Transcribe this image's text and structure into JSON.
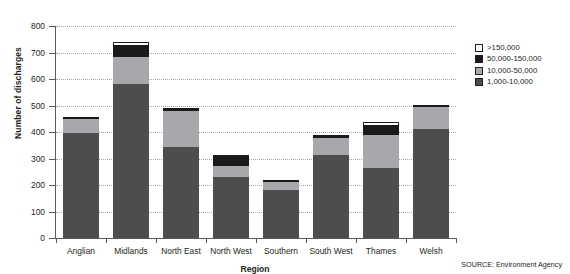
{
  "chart_data": {
    "type": "bar",
    "stacked": true,
    "title": "",
    "xlabel": "Region",
    "ylabel": "Number of discharges",
    "ylim": [
      0,
      800
    ],
    "ytick_step": 100,
    "yticks": [
      0,
      100,
      200,
      300,
      400,
      500,
      600,
      700,
      800
    ],
    "grid": true,
    "legend_position": "right",
    "categories": [
      "Anglian",
      "Midlands",
      "North East",
      "North West",
      "Southern",
      "South West",
      "Thames",
      "Welsh"
    ],
    "series": [
      {
        "name": "1,000-10,000",
        "color": "#4d4d4d",
        "values": [
          395,
          580,
          345,
          230,
          183,
          315,
          265,
          410
        ]
      },
      {
        "name": "10,000-50,000",
        "color": "#a6a8ab",
        "values": [
          55,
          105,
          133,
          42,
          29,
          63,
          125,
          85
        ]
      },
      {
        "name": "50,000-150,000",
        "color": "#1a1a1a",
        "values": [
          8,
          45,
          12,
          36,
          6,
          12,
          35,
          7
        ]
      },
      {
        "name": ">150,000",
        "color": "#ffffff",
        "values": [
          0,
          10,
          0,
          7,
          0,
          0,
          12,
          0
        ]
      }
    ],
    "totals": [
      458,
      740,
      490,
      315,
      218,
      390,
      437,
      502
    ]
  },
  "legend": {
    "entries": [
      {
        "label": ">150,000",
        "swatch": "sw-white"
      },
      {
        "label": "50,000-150,000",
        "swatch": "sw-black"
      },
      {
        "label": "10,000-50,000",
        "swatch": "sw-lgray"
      },
      {
        "label": "1,000-10,000",
        "swatch": "sw-dgray"
      }
    ]
  },
  "source": {
    "text": "SOURCE: Environment Agency"
  },
  "colors": {
    "axis": "#58595b",
    "grid": "#a7a9ac",
    "text": "#231f20"
  }
}
